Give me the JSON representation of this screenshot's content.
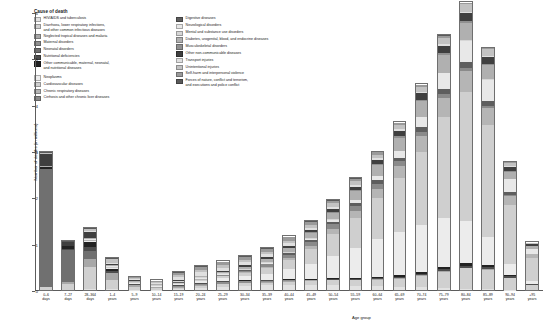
{
  "legend": {
    "title": "Cause of death",
    "column1": [
      {
        "label": "HIV/AIDS and tuberculosis",
        "color": "#e2e2e2"
      },
      {
        "label": "Diarrhoea, lower respiratory infections,\nand other common infectious diseases",
        "color": "#d0d0d0"
      },
      {
        "label": "Neglected tropical diseases and malaria",
        "color": "#a8a8a8"
      },
      {
        "label": "Maternal disorders",
        "color": "#8f8f8f"
      },
      {
        "label": "Neonatal disorders",
        "color": "#707070"
      },
      {
        "label": "Nutritional deficiencies",
        "color": "#4d4d4d"
      },
      {
        "label": "Other communicable, maternal, neonatal,\nand nutritional diseases",
        "color": "#222222"
      },
      {
        "label": "Neoplasms",
        "color": "#ececec"
      },
      {
        "label": "Cardiovascular diseases",
        "color": "#cfcfcf"
      },
      {
        "label": "Chronic respiratory diseases",
        "color": "#b5b5b5"
      },
      {
        "label": "Cirrhosis and other chronic liver diseases",
        "color": "#8a8a8a"
      }
    ],
    "column2": [
      {
        "label": "Digestive diseases",
        "color": "#5e5e5e"
      },
      {
        "label": "Neurological disorders",
        "color": "#e8e8e8"
      },
      {
        "label": "Mental and substance use disorders",
        "color": "#d6d6d6"
      },
      {
        "label": "Diabetes, urogenital, blood, and endocrine diseases",
        "color": "#b0b0b0"
      },
      {
        "label": "Musculoskeletal disorders",
        "color": "#909090"
      },
      {
        "label": "Other non-communicable diseases",
        "color": "#3f3f3f"
      },
      {
        "label": "Transport injuries",
        "color": "#e0e0e0"
      },
      {
        "label": "Unintentional injuries",
        "color": "#c2c2c2"
      },
      {
        "label": "Self-harm and interpersonal violence",
        "color": "#9a9a9a"
      },
      {
        "label": "Forces of nature, conflict and terrorism,\nand executions and police conflict",
        "color": "#5a5a5a"
      }
    ]
  },
  "chart_data": {
    "type": "bar",
    "title": "",
    "xlabel": "Age group",
    "ylabel": "Number of deaths (in millions)",
    "ylim": [
      0,
      6
    ],
    "yticks": [
      0,
      1,
      2,
      3,
      4,
      5,
      6
    ],
    "ytick_labels": [
      "0",
      "1",
      "2",
      "3",
      "4",
      "5",
      "6"
    ],
    "grid": false,
    "stacked": true,
    "legend_position": "top-left",
    "categories": [
      "0–6\ndays",
      "7–27\ndays",
      "28–364\ndays",
      "1–4\nyears",
      "5–9\nyears",
      "10–14\nyears",
      "15–19\nyears",
      "20–24\nyears",
      "25–29\nyears",
      "30–34\nyears",
      "35–39\nyears",
      "40–44\nyears",
      "45–49\nyears",
      "50–54\nyears",
      "55–59\nyears",
      "60–64\nyears",
      "65–69\nyears",
      "70–74\nyears",
      "75–79\nyears",
      "80–84\nyears",
      "85–89\nyears",
      "90–94\nyears",
      "+95\nyears"
    ],
    "totals": [
      3.02,
      1.1,
      1.38,
      0.62,
      0.32,
      0.26,
      0.42,
      0.55,
      0.57,
      0.66,
      0.8,
      1.0,
      1.32,
      1.72,
      2.12,
      2.62,
      3.18,
      3.96,
      5.02,
      5.8,
      4.86,
      2.6,
      1.08
    ],
    "series": [
      {
        "name": "HIV/AIDS and tuberculosis",
        "color": "#e2e2e2",
        "values": [
          0.0,
          0.0,
          0.02,
          0.02,
          0.01,
          0.01,
          0.02,
          0.05,
          0.08,
          0.1,
          0.11,
          0.12,
          0.12,
          0.11,
          0.09,
          0.08,
          0.07,
          0.06,
          0.05,
          0.03,
          0.02,
          0.01,
          0.0
        ]
      },
      {
        "name": "Diarrhoea, lower respiratory infections, and other common infectious diseases",
        "color": "#d0d0d0",
        "values": [
          0.06,
          0.14,
          0.5,
          0.22,
          0.07,
          0.04,
          0.04,
          0.04,
          0.05,
          0.05,
          0.06,
          0.07,
          0.08,
          0.1,
          0.12,
          0.14,
          0.18,
          0.24,
          0.34,
          0.44,
          0.42,
          0.26,
          0.12
        ]
      },
      {
        "name": "Neglected tropical diseases and malaria",
        "color": "#a8a8a8",
        "values": [
          0.01,
          0.03,
          0.18,
          0.14,
          0.04,
          0.02,
          0.02,
          0.02,
          0.02,
          0.02,
          0.02,
          0.02,
          0.02,
          0.02,
          0.02,
          0.02,
          0.02,
          0.02,
          0.02,
          0.01,
          0.01,
          0.0,
          0.0
        ]
      },
      {
        "name": "Maternal disorders",
        "color": "#8f8f8f",
        "values": [
          0.0,
          0.0,
          0.0,
          0.0,
          0.0,
          0.0,
          0.02,
          0.04,
          0.04,
          0.03,
          0.02,
          0.01,
          0.0,
          0.0,
          0.0,
          0.0,
          0.0,
          0.0,
          0.0,
          0.0,
          0.0,
          0.0,
          0.0
        ]
      },
      {
        "name": "Neonatal disorders",
        "color": "#707070",
        "values": [
          2.58,
          0.72,
          0.16,
          0.0,
          0.0,
          0.0,
          0.0,
          0.0,
          0.0,
          0.0,
          0.0,
          0.0,
          0.0,
          0.0,
          0.0,
          0.0,
          0.0,
          0.0,
          0.0,
          0.0,
          0.0,
          0.0,
          0.0
        ]
      },
      {
        "name": "Nutritional deficiencies",
        "color": "#4d4d4d",
        "values": [
          0.01,
          0.03,
          0.1,
          0.06,
          0.02,
          0.01,
          0.01,
          0.01,
          0.01,
          0.01,
          0.01,
          0.01,
          0.01,
          0.01,
          0.02,
          0.02,
          0.02,
          0.03,
          0.04,
          0.05,
          0.05,
          0.03,
          0.01
        ]
      },
      {
        "name": "Other communicable, maternal, neonatal, and nutritional diseases",
        "color": "#222222",
        "values": [
          0.04,
          0.06,
          0.12,
          0.05,
          0.02,
          0.01,
          0.01,
          0.01,
          0.01,
          0.01,
          0.01,
          0.02,
          0.02,
          0.02,
          0.02,
          0.03,
          0.03,
          0.04,
          0.05,
          0.06,
          0.05,
          0.03,
          0.01
        ]
      },
      {
        "name": "Neoplasms",
        "color": "#ececec",
        "values": [
          0.0,
          0.0,
          0.01,
          0.02,
          0.02,
          0.02,
          0.03,
          0.04,
          0.06,
          0.09,
          0.14,
          0.22,
          0.34,
          0.5,
          0.66,
          0.82,
          0.94,
          1.02,
          1.06,
          0.92,
          0.6,
          0.24,
          0.07
        ]
      },
      {
        "name": "Cardiovascular diseases",
        "color": "#cfcfcf",
        "values": [
          0.0,
          0.0,
          0.01,
          0.01,
          0.01,
          0.01,
          0.02,
          0.03,
          0.05,
          0.08,
          0.13,
          0.21,
          0.33,
          0.48,
          0.66,
          0.9,
          1.18,
          1.6,
          2.2,
          2.8,
          2.44,
          1.3,
          0.52
        ]
      },
      {
        "name": "Chronic respiratory diseases",
        "color": "#b5b5b5",
        "values": [
          0.0,
          0.0,
          0.01,
          0.01,
          0.01,
          0.01,
          0.01,
          0.01,
          0.01,
          0.02,
          0.03,
          0.04,
          0.06,
          0.1,
          0.14,
          0.2,
          0.26,
          0.34,
          0.42,
          0.46,
          0.38,
          0.2,
          0.07
        ]
      },
      {
        "name": "Cirrhosis and other chronic liver diseases",
        "color": "#8a8a8a",
        "values": [
          0.0,
          0.0,
          0.0,
          0.0,
          0.0,
          0.0,
          0.0,
          0.01,
          0.02,
          0.03,
          0.05,
          0.07,
          0.09,
          0.11,
          0.12,
          0.12,
          0.11,
          0.1,
          0.08,
          0.06,
          0.04,
          0.02,
          0.0
        ]
      },
      {
        "name": "Digestive diseases",
        "color": "#5e5e5e",
        "values": [
          0.0,
          0.0,
          0.01,
          0.01,
          0.0,
          0.0,
          0.01,
          0.01,
          0.01,
          0.02,
          0.02,
          0.03,
          0.04,
          0.05,
          0.06,
          0.07,
          0.08,
          0.1,
          0.12,
          0.13,
          0.11,
          0.06,
          0.02
        ]
      },
      {
        "name": "Neurological disorders",
        "color": "#e8e8e8",
        "values": [
          0.0,
          0.0,
          0.01,
          0.01,
          0.01,
          0.01,
          0.01,
          0.01,
          0.01,
          0.01,
          0.02,
          0.02,
          0.03,
          0.04,
          0.06,
          0.09,
          0.14,
          0.22,
          0.34,
          0.46,
          0.46,
          0.28,
          0.11
        ]
      },
      {
        "name": "Mental and substance use disorders",
        "color": "#d6d6d6",
        "values": [
          0.0,
          0.0,
          0.0,
          0.0,
          0.0,
          0.0,
          0.01,
          0.02,
          0.02,
          0.02,
          0.02,
          0.02,
          0.02,
          0.02,
          0.02,
          0.01,
          0.01,
          0.01,
          0.01,
          0.01,
          0.01,
          0.0,
          0.0
        ]
      },
      {
        "name": "Diabetes, urogenital, blood, and endocrine diseases",
        "color": "#b0b0b0",
        "values": [
          0.01,
          0.01,
          0.03,
          0.02,
          0.01,
          0.01,
          0.02,
          0.02,
          0.03,
          0.04,
          0.06,
          0.08,
          0.11,
          0.15,
          0.19,
          0.24,
          0.29,
          0.34,
          0.38,
          0.38,
          0.3,
          0.16,
          0.06
        ]
      },
      {
        "name": "Musculoskeletal disorders",
        "color": "#909090",
        "values": [
          0.0,
          0.0,
          0.0,
          0.0,
          0.0,
          0.0,
          0.0,
          0.0,
          0.0,
          0.01,
          0.01,
          0.01,
          0.01,
          0.02,
          0.02,
          0.02,
          0.03,
          0.03,
          0.04,
          0.04,
          0.03,
          0.02,
          0.01
        ]
      },
      {
        "name": "Other non-communicable diseases",
        "color": "#3f3f3f",
        "values": [
          0.28,
          0.08,
          0.14,
          0.04,
          0.02,
          0.01,
          0.02,
          0.02,
          0.02,
          0.03,
          0.03,
          0.04,
          0.05,
          0.06,
          0.07,
          0.09,
          0.11,
          0.14,
          0.17,
          0.18,
          0.16,
          0.09,
          0.04
        ]
      },
      {
        "name": "Transport injuries",
        "color": "#e0e0e0",
        "values": [
          0.0,
          0.0,
          0.01,
          0.02,
          0.03,
          0.03,
          0.07,
          0.09,
          0.08,
          0.07,
          0.07,
          0.06,
          0.06,
          0.05,
          0.05,
          0.04,
          0.04,
          0.03,
          0.03,
          0.02,
          0.02,
          0.01,
          0.0
        ]
      },
      {
        "name": "Unintentional injuries",
        "color": "#c2c2c2",
        "values": [
          0.02,
          0.02,
          0.06,
          0.08,
          0.04,
          0.03,
          0.04,
          0.05,
          0.05,
          0.05,
          0.05,
          0.06,
          0.06,
          0.07,
          0.07,
          0.08,
          0.09,
          0.11,
          0.14,
          0.16,
          0.14,
          0.08,
          0.03
        ]
      },
      {
        "name": "Self-harm and interpersonal violence",
        "color": "#9a9a9a",
        "values": [
          0.0,
          0.0,
          0.0,
          0.01,
          0.01,
          0.02,
          0.05,
          0.07,
          0.07,
          0.07,
          0.07,
          0.07,
          0.07,
          0.06,
          0.06,
          0.05,
          0.05,
          0.04,
          0.04,
          0.03,
          0.02,
          0.01,
          0.0
        ]
      },
      {
        "name": "Forces of nature, conflict and terrorism, and executions and police conflict",
        "color": "#5a5a5a",
        "values": [
          0.01,
          0.01,
          0.01,
          0.02,
          0.01,
          0.01,
          0.02,
          0.02,
          0.02,
          0.02,
          0.02,
          0.02,
          0.02,
          0.02,
          0.01,
          0.01,
          0.01,
          0.01,
          0.01,
          0.01,
          0.0,
          0.0,
          0.0
        ]
      }
    ]
  }
}
